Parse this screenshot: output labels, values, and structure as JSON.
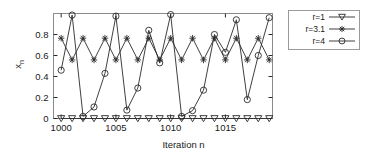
{
  "chart_data": {
    "type": "line",
    "title": "",
    "xlabel": "Iteration n",
    "ylabel": "x_n",
    "ylabel_display": "x",
    "ylabel_sub": "n",
    "xlim": [
      999.3,
      1019.3
    ],
    "ylim": [
      0,
      1.0
    ],
    "xticks": [
      1000,
      1005,
      1010,
      1015
    ],
    "xticklabels": [
      "1000",
      "1005",
      "1010",
      "1015"
    ],
    "yticks": [
      0,
      0.2,
      0.4,
      0.6,
      0.8
    ],
    "yticklabels": [
      "0",
      "0.2",
      "0.4",
      "0.6",
      "0.8"
    ],
    "grid": false,
    "frame": "box",
    "legend_position": "outside-right-top",
    "x": [
      1000,
      1001,
      1002,
      1003,
      1004,
      1005,
      1006,
      1007,
      1008,
      1009,
      1010,
      1011,
      1012,
      1013,
      1014,
      1015,
      1016,
      1017,
      1018,
      1019
    ],
    "series": [
      {
        "name": "r=1",
        "label": "r=1",
        "marker": "triangle-down",
        "color": "#1a1a1a",
        "values": [
          0,
          0,
          0,
          0,
          0,
          0,
          0,
          0,
          0,
          0,
          0,
          0,
          0,
          0,
          0,
          0,
          0,
          0,
          0,
          0
        ]
      },
      {
        "name": "r=3.1",
        "label": "r=3.1",
        "marker": "asterisk",
        "color": "#1a1a1a",
        "values": [
          0.765,
          0.558,
          0.765,
          0.558,
          0.765,
          0.558,
          0.765,
          0.558,
          0.765,
          0.558,
          0.765,
          0.558,
          0.765,
          0.558,
          0.765,
          0.558,
          0.765,
          0.558,
          0.765,
          0.558
        ]
      },
      {
        "name": "r=4",
        "label": "r=4",
        "marker": "circle",
        "color": "#1a1a1a",
        "values": [
          0.46,
          0.985,
          0.02,
          0.11,
          0.43,
          0.975,
          0.08,
          0.29,
          0.84,
          0.53,
          0.99,
          0.02,
          0.075,
          0.27,
          0.8,
          0.63,
          0.94,
          0.18,
          0.6,
          0.96
        ]
      }
    ]
  },
  "legend": {
    "entries": [
      {
        "label": "r=1",
        "marker": "triangle-down"
      },
      {
        "label": "r=3.1",
        "marker": "asterisk"
      },
      {
        "label": "r=4",
        "marker": "circle"
      }
    ]
  }
}
